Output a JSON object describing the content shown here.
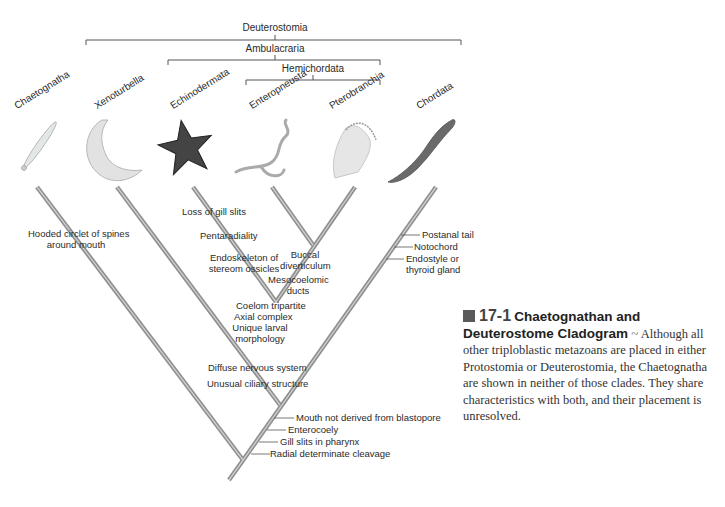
{
  "clades": {
    "deuterostomia": "Deuterostomia",
    "ambulacraria": "Ambulacraria",
    "hemichordata": "Hemichordata"
  },
  "taxa": [
    {
      "name": "Chaetognatha",
      "icon": "arrow-worm-illustration"
    },
    {
      "name": "Xenoturbella",
      "icon": "xenoturbella-illustration"
    },
    {
      "name": "Echinodermata",
      "icon": "starfish-illustration"
    },
    {
      "name": "Enteropneusta",
      "icon": "acorn-worm-illustration"
    },
    {
      "name": "Pterobranchia",
      "icon": "pterobranch-illustration"
    },
    {
      "name": "Chordata",
      "icon": "lancelet-illustration"
    }
  ],
  "characters": {
    "chaetognatha": [
      "Hooded circlet of spines",
      "around mouth"
    ],
    "echinodermata": [
      "Loss of gill slits",
      "Pentaradiality",
      "Endoskeleton of",
      "stereom ossicles"
    ],
    "hemichordata": [
      "Buccal",
      "diverticulum",
      "Mesocoelomic",
      "ducts"
    ],
    "ambulacraria": [
      "Coelom tripartite",
      "Axial complex",
      "Unique larval",
      "morphology"
    ],
    "xeno_ambulacraria": [
      "Diffuse nervous system",
      "Unusual ciliary structure"
    ],
    "chordata": [
      "Postanal tail",
      "Notochord",
      "Endostyle or",
      "thyroid gland"
    ],
    "deuterostomia": [
      "Mouth not derived from blastopore",
      "Enterocoely",
      "Gill slits in pharynx",
      "Radial determinate cleavage"
    ]
  },
  "caption": {
    "number": "17-1",
    "title": "Chaetognathan and Deuterostome Cladogram",
    "separator": "~",
    "body": "Although all other triploblastic metazoans are placed in either Protostomia or Deuterostomia, the Chaetognatha are shown in neither of those clades. They share characteristics with both, and their placement is unresolved."
  },
  "colors": {
    "branch": "#9a9a9a",
    "branch_highlight": "#c8c8c8",
    "bracket": "#555555",
    "caption_square": "#5a5a5a"
  }
}
